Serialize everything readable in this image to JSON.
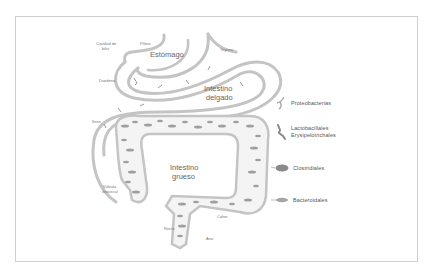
{
  "diagram": {
    "organs": {
      "stomach": "Estómago",
      "small_intestine_1": "Intestino",
      "small_intestine_2": "delgado",
      "large_intestine_1": "Intestino",
      "large_intestine_2": "grueso"
    },
    "anatomy_labels": {
      "gallbladder_1": "Cavidad de",
      "gallbladder_2": "bilis",
      "pylorus": "Píloro",
      "jejunum": "Yeyuno",
      "duodenum": "Duodeno",
      "ileum": "Íleon",
      "ileocecal_1": "Válvula",
      "ileocecal_2": "ileocecal",
      "colon": "Colon",
      "rectum": "Recto",
      "anus": "Ano"
    },
    "legend": [
      {
        "icon": "proteobacteria-icon",
        "label": "Proteobacterias"
      },
      {
        "icon": "lactobacillales-icon",
        "label_1": "Lactobacillales",
        "label_2": "Erysipelotrichales"
      },
      {
        "icon": "clostridiales-icon",
        "label": "Clostridiales"
      },
      {
        "icon": "bacteroidales-icon",
        "label": "Bacteroidales"
      }
    ],
    "colors": {
      "tract": "#bdbdbd",
      "bacteria": "#8a8a8a",
      "frame": "#cfcfcf"
    }
  }
}
